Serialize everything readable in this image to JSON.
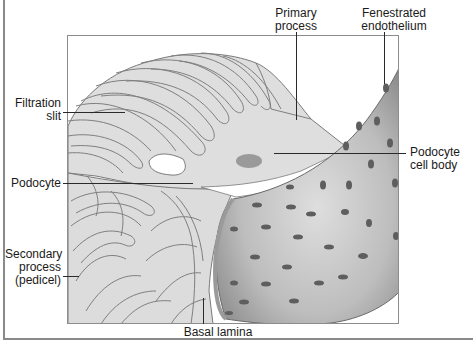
{
  "diagram": {
    "colors": {
      "podocyte_fill": "#dcdcdc",
      "podocyte_outline": "#7a7a7a",
      "vessel_dark": "#8e8e8e",
      "vessel_light": "#d6d6d6",
      "fenestra": "#5e5e5e",
      "nucleus": "#9a9a9a",
      "frame": "#8a8a8a"
    },
    "labels": {
      "filtration_slit": [
        "Filtration",
        "slit"
      ],
      "podocyte": "Podocyte",
      "secondary_process": [
        "Secondary",
        "process",
        "(pedicel)"
      ],
      "primary_process": [
        "Primary",
        "process"
      ],
      "fenestrated_endothelium": [
        "Fenestrated",
        "endothelium"
      ],
      "podocyte_cell_body": [
        "Podocyte",
        "cell body"
      ],
      "basal_lamina": "Basal lamina"
    }
  }
}
